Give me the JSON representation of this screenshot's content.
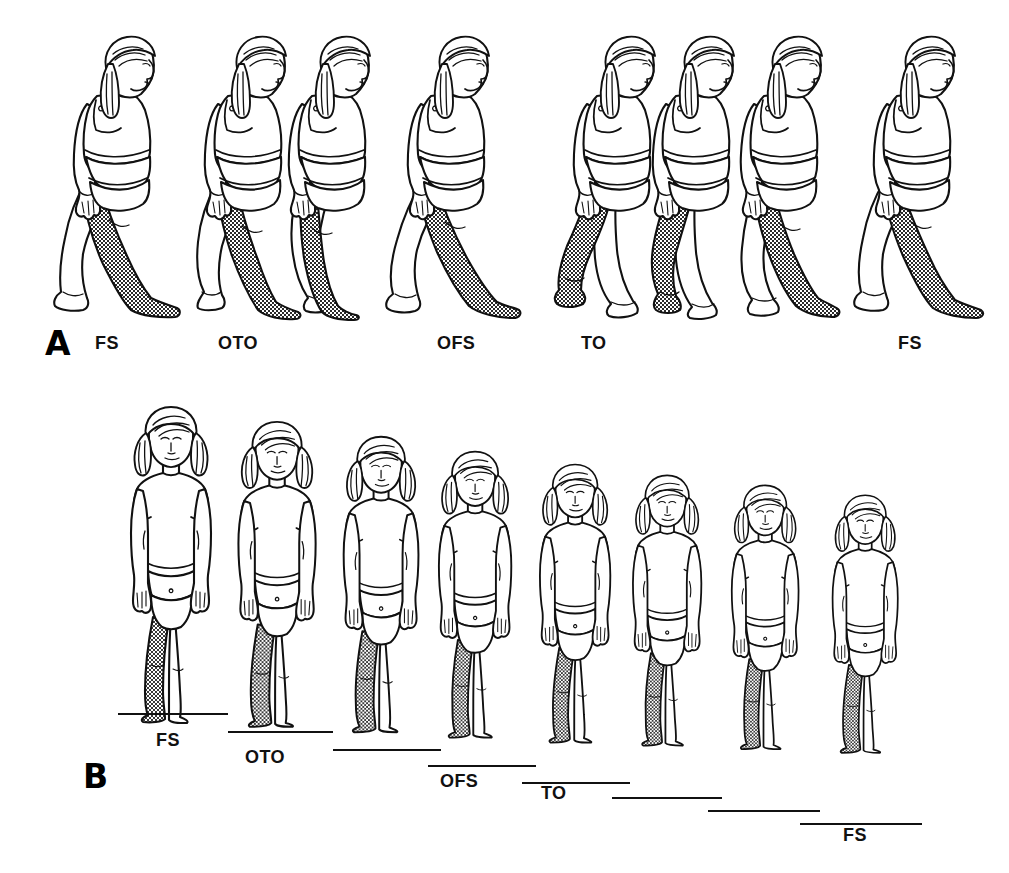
{
  "figure": {
    "background_color": "#ffffff",
    "line_color": "#111111",
    "shaded_limb_color": "#808080",
    "shaded_limb_pattern": "stipple-crosshatch"
  },
  "panels": [
    {
      "id": "A",
      "letter": "A",
      "view": "sagittal-side-view",
      "letter_pos": {
        "x": 45,
        "y": 327
      },
      "frames": 8,
      "labels": [
        {
          "text": "FS",
          "x": 95,
          "y": 334,
          "meaning": "foot strike"
        },
        {
          "text": "OTO",
          "x": 218,
          "y": 334,
          "meaning": "opposite toe off"
        },
        {
          "text": "OFS",
          "x": 437,
          "y": 334,
          "meaning": "opposite foot strike"
        },
        {
          "text": "TO",
          "x": 581,
          "y": 334,
          "meaning": "toe off"
        },
        {
          "text": "FS",
          "x": 898,
          "y": 334,
          "meaning": "foot strike"
        }
      ],
      "figure_positions": [
        {
          "x": 118,
          "y": 30,
          "scale": 1.0,
          "pose": "side-fs-lead",
          "swing": 1.0
        },
        {
          "x": 248,
          "y": 30,
          "scale": 1.0,
          "pose": "side-oto",
          "swing": 0.62
        },
        {
          "x": 333,
          "y": 30,
          "scale": 1.0,
          "pose": "side-midstance",
          "swing": 0.22
        },
        {
          "x": 453,
          "y": 30,
          "scale": 1.0,
          "pose": "side-ofs",
          "swing": 0.95
        },
        {
          "x": 614,
          "y": 30,
          "scale": 1.0,
          "pose": "side-to",
          "swing": 0.7
        },
        {
          "x": 694,
          "y": 30,
          "scale": 1.0,
          "pose": "side-swing-early",
          "swing": 0.3
        },
        {
          "x": 783,
          "y": 30,
          "scale": 1.0,
          "pose": "side-swing-late",
          "swing": 0.55
        },
        {
          "x": 918,
          "y": 30,
          "scale": 1.0,
          "pose": "side-fs-final",
          "swing": 1.0
        }
      ]
    },
    {
      "id": "B",
      "letter": "B",
      "view": "frontal-view",
      "letter_pos": {
        "x": 83,
        "y": 760
      },
      "frames": 8,
      "labels": [
        {
          "text": "FS",
          "x": 156,
          "y": 731,
          "meaning": "foot strike"
        },
        {
          "text": "OTO",
          "x": 245,
          "y": 748,
          "meaning": "opposite toe off"
        },
        {
          "text": "OFS",
          "x": 440,
          "y": 772,
          "meaning": "opposite foot strike"
        },
        {
          "text": "TO",
          "x": 541,
          "y": 784,
          "meaning": "toe off"
        },
        {
          "text": "FS",
          "x": 843,
          "y": 826,
          "meaning": "foot strike"
        }
      ],
      "figure_positions": [
        {
          "x": 172,
          "y": 403,
          "scale": 1.0,
          "baseline_y": 713,
          "baseline_x": 118,
          "baseline_w": 110
        },
        {
          "x": 278,
          "y": 418,
          "scale": 0.965,
          "baseline_y": 731,
          "baseline_x": 228,
          "baseline_w": 105
        },
        {
          "x": 382,
          "y": 433,
          "scale": 0.935,
          "baseline_y": 749,
          "baseline_x": 333,
          "baseline_w": 108
        },
        {
          "x": 476,
          "y": 448,
          "scale": 0.905,
          "baseline_y": 765,
          "baseline_x": 428,
          "baseline_w": 108
        },
        {
          "x": 576,
          "y": 461,
          "scale": 0.88,
          "baseline_y": 782,
          "baseline_x": 522,
          "baseline_w": 108
        },
        {
          "x": 668,
          "y": 472,
          "scale": 0.855,
          "baseline_y": 797,
          "baseline_x": 612,
          "baseline_w": 110
        },
        {
          "x": 766,
          "y": 482,
          "scale": 0.835,
          "baseline_y": 810,
          "baseline_x": 708,
          "baseline_w": 112
        },
        {
          "x": 866,
          "y": 492,
          "scale": 0.815,
          "baseline_y": 823,
          "baseline_x": 800,
          "baseline_w": 122
        }
      ]
    }
  ],
  "legend_terms": {
    "FS": "Foot Strike",
    "OTO": "Opposite Toe Off",
    "OFS": "Opposite Foot Strike",
    "TO": "Toe Off"
  }
}
